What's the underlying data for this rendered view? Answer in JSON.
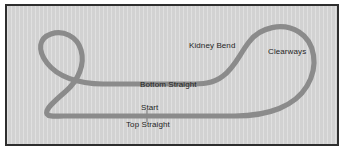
{
  "figure": {
    "kind": "circuit-map",
    "frame_border_color": "#2e2e2e",
    "background_color": "#d2d2d2",
    "page_color": "#ffffff"
  },
  "map": {
    "track_color": "#8b8b8b",
    "track_width_px": 5,
    "labels": [
      {
        "id": "kidney-bend",
        "text": "Kidney Bend"
      },
      {
        "id": "clearways",
        "text": "Clearways"
      },
      {
        "id": "bottom-straight",
        "text": "Bottom Straight"
      },
      {
        "id": "start",
        "text": "Start"
      },
      {
        "id": "top-straight",
        "text": "Top Straight"
      }
    ],
    "markers": [
      {
        "id": "start-line",
        "name": "start-finish-line"
      }
    ]
  },
  "geometry": {
    "circuit_path": "M 57 110 L 228 110 C 262 110 288 100 300 80 C 312 60 308 36 292 26 C 276 16 253 21 242 36 C 232 49 228 61 216 70 C 206 78 194 78 182 78 L 96 78 C 70 78 50 70 40 57 C 30 44 32 32 44 28 C 56 24 70 30 74 44 C 78 58 72 74 58 86 C 44 98 38 104 40 108 C 42 111 48 110 57 110 Z",
    "start_tick": {
      "x": 140,
      "y1": 104,
      "y2": 116
    }
  }
}
